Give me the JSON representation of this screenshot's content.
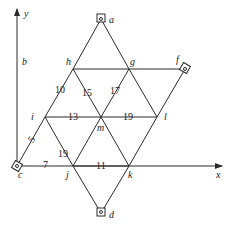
{
  "diagram": {
    "axes": {
      "x_label": "x",
      "y_label": "y",
      "y_side_label": "b"
    },
    "nodes": {
      "a": {
        "label": "a",
        "x": 101,
        "y": 19,
        "support": true
      },
      "h": {
        "label": "h",
        "x": 73,
        "y": 69
      },
      "g": {
        "label": "g",
        "x": 129,
        "y": 69
      },
      "f": {
        "label": "f",
        "x": 185,
        "y": 69,
        "support": true
      },
      "i": {
        "label": "i",
        "x": 45,
        "y": 117
      },
      "m": {
        "label": "m",
        "x": 101,
        "y": 117
      },
      "l": {
        "label": "l",
        "x": 157,
        "y": 117
      },
      "c": {
        "label": "c",
        "x": 17,
        "y": 166,
        "support": true
      },
      "j": {
        "label": "j",
        "x": 73,
        "y": 166
      },
      "k": {
        "label": "k",
        "x": 129,
        "y": 166
      },
      "d": {
        "label": "d",
        "x": 101,
        "y": 213,
        "support": true
      }
    },
    "edge_labels": {
      "hi": "10",
      "hm": "15",
      "gm": "17",
      "im": "13",
      "ml": "19",
      "ic": "5",
      "ij": "19",
      "cj": "7",
      "jk": "11"
    }
  }
}
